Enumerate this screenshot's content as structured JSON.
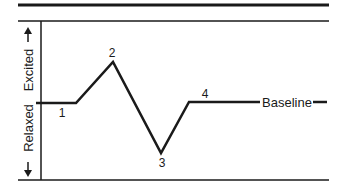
{
  "diagram": {
    "y_axis": {
      "top_label": "Excited",
      "bottom_label": "Relaxed",
      "top_arrow": "arrow-up",
      "bottom_arrow": "arrow-down"
    },
    "baseline_label": "Baseline",
    "points": [
      {
        "label": "1",
        "description": "start at baseline"
      },
      {
        "label": "2",
        "description": "peak (excited)"
      },
      {
        "label": "3",
        "description": "trough (relaxed)"
      },
      {
        "label": "4",
        "description": "return to baseline"
      }
    ],
    "colors": {
      "line": "#1a1a1a",
      "background": "#ffffff"
    }
  }
}
